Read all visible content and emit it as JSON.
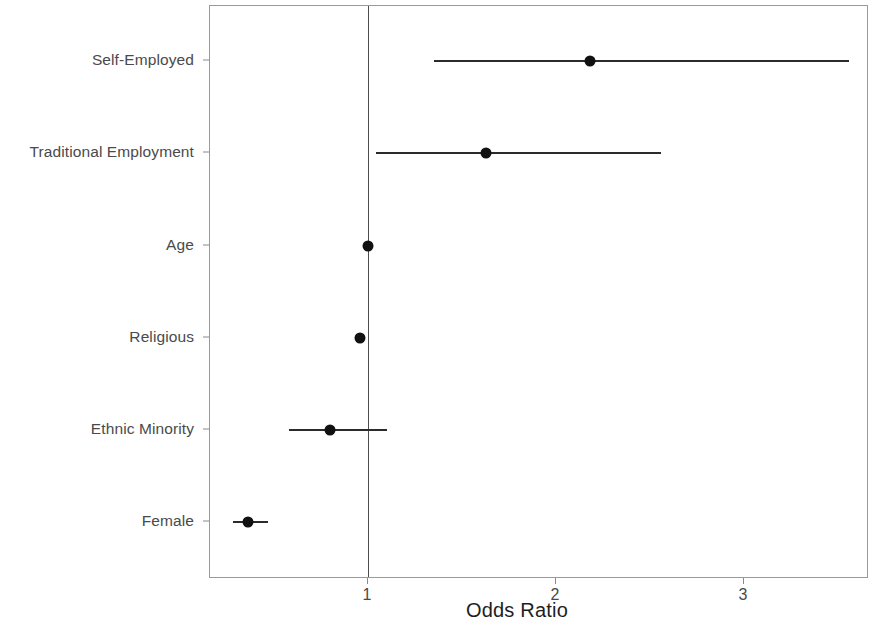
{
  "chart_data": {
    "type": "scatter",
    "subtype": "forest-plot",
    "title": "",
    "xlabel": "Odds Ratio",
    "ylabel": "",
    "xticks": [
      1,
      2,
      3
    ],
    "xtick_labels": [
      "1",
      "2",
      "3"
    ],
    "xlim": [
      0.3,
      3.66
    ],
    "grid": false,
    "legend": null,
    "reference_line": 1,
    "categories": [
      "Self-Employed",
      "Traditional Employment",
      "Age",
      "Religious",
      "Ethnic Minority",
      "Female"
    ],
    "values": [
      2.18,
      1.63,
      1.0,
      0.96,
      0.8,
      0.36
    ],
    "ci_low": [
      1.35,
      1.04,
      1.0,
      0.96,
      0.58,
      0.28
    ],
    "ci_high": [
      3.56,
      2.56,
      1.0,
      0.98,
      1.1,
      0.47
    ],
    "points": [
      {
        "label": "Self-Employed",
        "or": 2.18,
        "ci_low": 1.35,
        "ci_high": 3.56
      },
      {
        "label": "Traditional Employment",
        "or": 1.63,
        "ci_low": 1.04,
        "ci_high": 2.56
      },
      {
        "label": "Age",
        "or": 1.0,
        "ci_low": 1.0,
        "ci_high": 1.0
      },
      {
        "label": "Religious",
        "or": 0.96,
        "ci_low": 0.96,
        "ci_high": 0.98
      },
      {
        "label": "Ethnic Minority",
        "or": 0.8,
        "ci_low": 0.58,
        "ci_high": 1.1
      },
      {
        "label": "Female",
        "or": 0.36,
        "ci_low": 0.28,
        "ci_high": 0.47
      }
    ],
    "colors": {
      "point": "#111111",
      "ci": "#2b2b2b",
      "reference_line": "#4d4d4d",
      "panel_border": "#9a9a9a",
      "axis_text": "#4a4a4a",
      "title_text": "#1e1e1e",
      "background": "#ffffff"
    }
  }
}
